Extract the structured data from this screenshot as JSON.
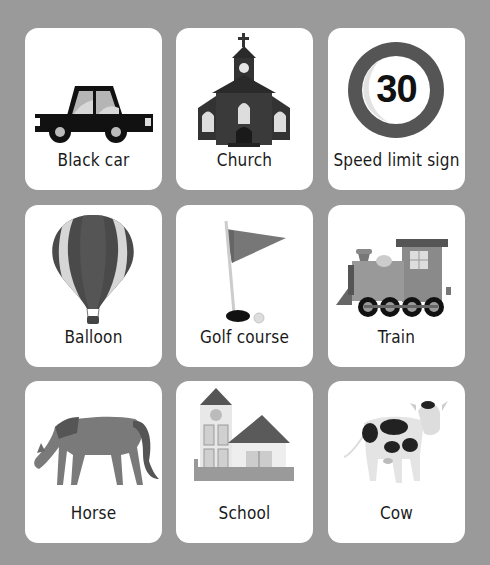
{
  "background_color": "#9a9a9a",
  "cards": [
    {
      "label": "Black car",
      "icon": "car-icon"
    },
    {
      "label": "Church",
      "icon": "church-icon"
    },
    {
      "label": "Speed limit sign",
      "icon": "speed-limit-sign-icon",
      "sign_number": "30"
    },
    {
      "label": "Balloon",
      "icon": "hot-air-balloon-icon"
    },
    {
      "label": "Golf course",
      "icon": "golf-flag-icon"
    },
    {
      "label": "Train",
      "icon": "steam-train-icon"
    },
    {
      "label": "Horse",
      "icon": "horse-icon"
    },
    {
      "label": "School",
      "icon": "school-icon"
    },
    {
      "label": "Cow",
      "icon": "cow-icon"
    }
  ]
}
